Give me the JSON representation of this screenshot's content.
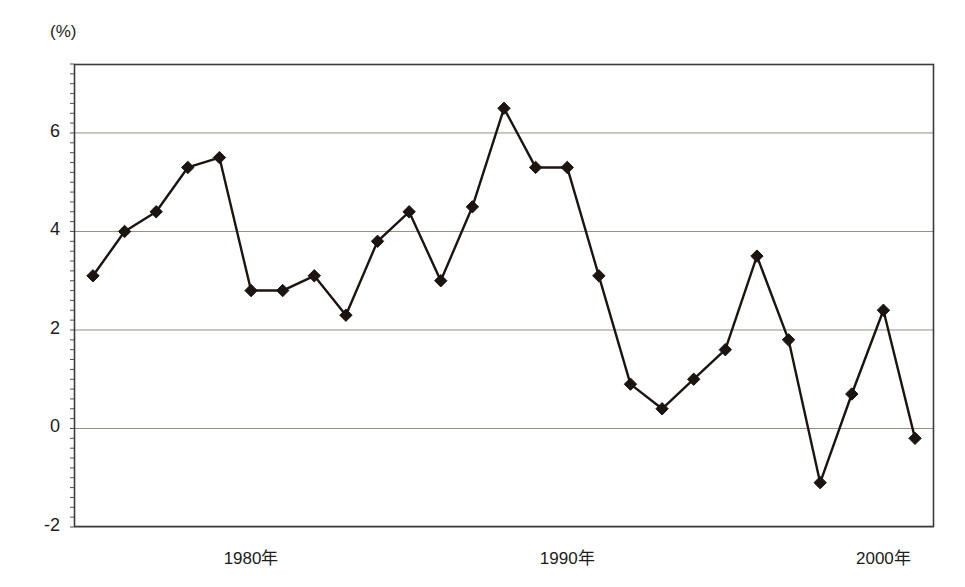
{
  "chart_data": {
    "type": "line",
    "title": "",
    "subtitle": "",
    "xlabel": "",
    "ylabel": "(%)",
    "unit_label": "(%)",
    "grid": true,
    "grid_axis": "y",
    "legend": "none",
    "xlim": [
      1974.4,
      2001.6
    ],
    "ylim": [
      -2,
      7.4
    ],
    "yticks": [
      -2,
      0,
      2,
      4,
      6
    ],
    "ytick_labels": [
      "-2",
      "0",
      "2",
      "4",
      "6"
    ],
    "xticks": [
      1980,
      1990,
      2000
    ],
    "xtick_labels": [
      "1980年",
      "1990年",
      "2000年"
    ],
    "marker": "diamond",
    "line_color": "#1c1410",
    "marker_color": "#1c1410",
    "grid_color": "#8e9080",
    "axis_color": "#3b3b3b",
    "x": [
      1975,
      1976,
      1977,
      1978,
      1979,
      1980,
      1981,
      1982,
      1983,
      1984,
      1985,
      1986,
      1987,
      1988,
      1989,
      1990,
      1991,
      1992,
      1993,
      1994,
      1995,
      1996,
      1997,
      1998,
      1999,
      2000,
      2001
    ],
    "values": [
      3.1,
      4.0,
      4.4,
      5.3,
      5.5,
      2.8,
      2.8,
      3.1,
      2.3,
      3.8,
      4.4,
      3.0,
      4.5,
      6.5,
      5.3,
      5.3,
      3.1,
      0.9,
      0.4,
      1.0,
      1.6,
      3.5,
      1.8,
      -1.1,
      0.7,
      2.4,
      -0.2
    ],
    "series": [
      {
        "name": "",
        "values": [
          3.1,
          4.0,
          4.4,
          5.3,
          5.5,
          2.8,
          2.8,
          3.1,
          2.3,
          3.8,
          4.4,
          3.0,
          4.5,
          6.5,
          5.3,
          5.3,
          3.1,
          0.9,
          0.4,
          1.0,
          1.6,
          3.5,
          1.8,
          -1.1,
          0.7,
          2.4,
          -0.2
        ]
      }
    ]
  }
}
